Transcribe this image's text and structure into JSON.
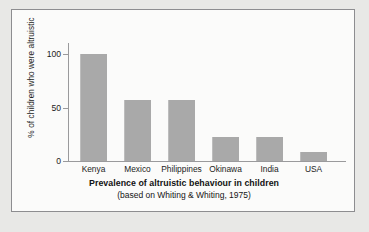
{
  "chart_data": {
    "type": "bar",
    "title": "Prevalence of altruistic behaviour in children",
    "subtitle": "(based on Whiting & Whiting, 1975)",
    "xlabel": "",
    "ylabel": "% of children who were altruistic",
    "categories": [
      "Kenya",
      "Mexico",
      "Philippines",
      "Okinawa",
      "India",
      "USA"
    ],
    "values": [
      100,
      57,
      57,
      22,
      22,
      8
    ],
    "ylim": [
      0,
      100
    ],
    "yticks": [
      0,
      50,
      100
    ],
    "ytick_labels": [
      "0",
      "50",
      "100"
    ],
    "grid": false,
    "legend": false,
    "bar_color": "#a9a9a9",
    "axis_color": "#9a9a9c",
    "plot_background": "#fbfbfa",
    "page_background": "#e8e8e6",
    "panel_border_color": "#8d8d90"
  }
}
